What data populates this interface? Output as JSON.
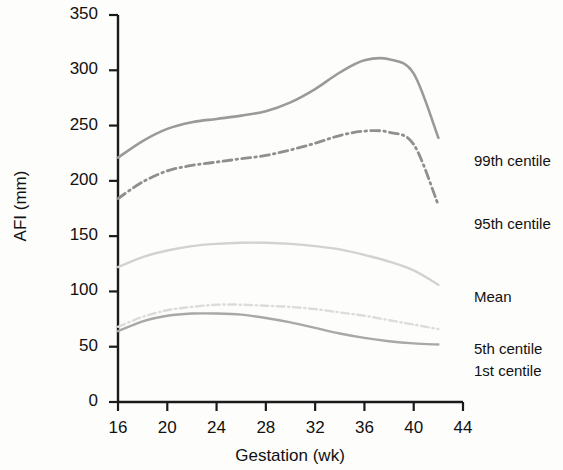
{
  "chart_data": {
    "type": "line",
    "title": "",
    "xlabel": "Gestation (wk)",
    "ylabel": "AFI (mm)",
    "xlim": [
      16,
      44
    ],
    "ylim": [
      0,
      350
    ],
    "xticks": [
      16,
      20,
      24,
      28,
      32,
      36,
      40,
      44
    ],
    "yticks": [
      0,
      50,
      100,
      150,
      200,
      250,
      300,
      350
    ],
    "xtick_labels": [
      "16",
      "20",
      "24",
      "28",
      "32",
      "36",
      "40",
      "44"
    ],
    "ytick_labels": [
      "0",
      "50",
      "100",
      "150",
      "200",
      "250",
      "300",
      "350"
    ],
    "grid": false,
    "legend_position": "right",
    "x": [
      16,
      18,
      20,
      22,
      24,
      26,
      28,
      30,
      32,
      34,
      36,
      38,
      40,
      42
    ],
    "series": [
      {
        "name": "99th centile",
        "label": "99th centile",
        "style": "solid",
        "color": "#9a9a9a",
        "width": 2.6,
        "values": [
          221,
          236,
          247,
          253,
          256,
          259,
          263,
          271,
          283,
          298,
          309,
          310,
          297,
          239
        ]
      },
      {
        "name": "95th centile",
        "label": "95th centile",
        "style": "dash-dot",
        "color": "#8f8f8f",
        "width": 2.8,
        "values": [
          184,
          199,
          209,
          214,
          217,
          220,
          223,
          228,
          234,
          241,
          245,
          244,
          233,
          178
        ]
      },
      {
        "name": "Mean",
        "label": "Mean",
        "style": "solid",
        "color": "#d2d2d2",
        "width": 2.4,
        "values": [
          122,
          131,
          137,
          141,
          143,
          144,
          144,
          143,
          141,
          138,
          133,
          127,
          119,
          106
        ]
      },
      {
        "name": "5th centile",
        "label": "5th centile",
        "style": "dash-dot",
        "color": "#dcdcdc",
        "width": 2.4,
        "values": [
          68,
          77,
          83,
          86,
          88,
          88,
          87,
          86,
          84,
          81,
          78,
          74,
          70,
          66
        ]
      },
      {
        "name": "1st centile",
        "label": "1st centile",
        "style": "solid",
        "color": "#a8a8a8",
        "width": 2.4,
        "values": [
          64,
          73,
          78,
          80,
          80,
          79,
          76,
          72,
          67,
          62,
          58,
          55,
          53,
          52
        ]
      }
    ]
  },
  "axes": {
    "y_title": "AFI (mm)",
    "x_title": "Gestation (wk)"
  },
  "legend": {
    "items": [
      {
        "label": "99th centile"
      },
      {
        "label": "95th centile"
      },
      {
        "label": "Mean"
      },
      {
        "label": "5th centile"
      },
      {
        "label": "1st centile"
      }
    ]
  }
}
